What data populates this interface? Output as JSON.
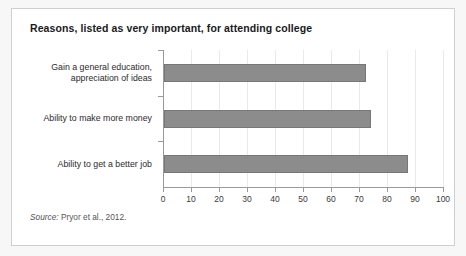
{
  "figure": {
    "title": "Reasons, listed as very important, for attending college",
    "source_label": "Source:",
    "source_text": " Pryor et al., 2012.",
    "card_background": "#ffffff",
    "page_background": "#f7f7f7",
    "border_color": "#cfcfcf"
  },
  "chart_data": {
    "type": "bar",
    "orientation": "horizontal",
    "title": "Reasons, listed as very important, for attending college",
    "categories": [
      "Ability to get a better job",
      "Ability to make more money",
      "Gain a general education, appreciation of ideas"
    ],
    "values": [
      87,
      74,
      72
    ],
    "xlabel": "",
    "ylabel": "",
    "xlim": [
      0,
      100
    ],
    "xticks": [
      0,
      10,
      20,
      30,
      40,
      50,
      60,
      70,
      80,
      90,
      100
    ],
    "xtick_labels": [
      "0",
      "10",
      "20",
      "30",
      "40",
      "50",
      "60",
      "70",
      "80",
      "90",
      "100"
    ],
    "grid": "vertical",
    "legend": "none",
    "bar_color": "#8c8c8c",
    "bar_edge_color": "#777777",
    "source": "Source: Pryor et al., 2012."
  },
  "category_lines": {
    "top_line_1": "Gain a general education,",
    "top_line_2": "appreciation of ideas",
    "middle": "Ability to make more money",
    "bottom": "Ability to get a better job"
  }
}
